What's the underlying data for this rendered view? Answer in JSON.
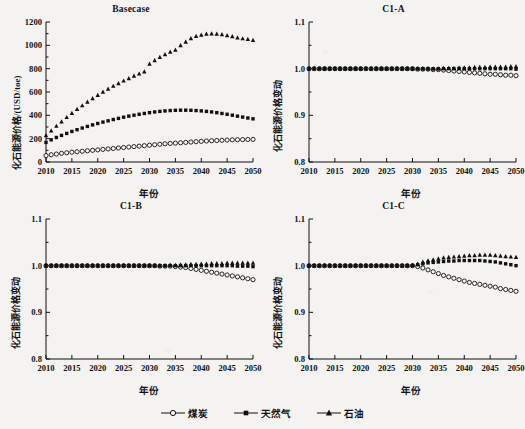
{
  "figure": {
    "xlabel": "年份",
    "legend": [
      {
        "name": "coal",
        "label": "煤炭",
        "marker": "open-circle"
      },
      {
        "name": "natural-gas",
        "label": "天然气",
        "marker": "filled-square"
      },
      {
        "name": "oil",
        "label": "石油",
        "marker": "filled-triangle"
      }
    ]
  },
  "chart_data": [
    {
      "type": "scatter",
      "title": "Basecase",
      "xlabel": "年份",
      "ylabel": "化石能源价格/(USD/toe)",
      "xlim": [
        2010,
        2050
      ],
      "ylim": [
        0,
        1200
      ],
      "xticks": [
        2010,
        2015,
        2020,
        2025,
        2030,
        2035,
        2040,
        2045,
        2050
      ],
      "yticks": [
        0,
        200,
        400,
        600,
        800,
        1000,
        1200
      ],
      "grid": false,
      "legend_position": "figure-bottom",
      "x": [
        2010,
        2011,
        2012,
        2013,
        2014,
        2015,
        2016,
        2017,
        2018,
        2019,
        2020,
        2021,
        2022,
        2023,
        2024,
        2025,
        2026,
        2027,
        2028,
        2029,
        2030,
        2031,
        2032,
        2033,
        2034,
        2035,
        2036,
        2037,
        2038,
        2039,
        2040,
        2041,
        2042,
        2043,
        2044,
        2045,
        2046,
        2047,
        2048,
        2049,
        2050
      ],
      "series": [
        {
          "name": "煤炭",
          "marker": "open-circle",
          "values": [
            55,
            62,
            68,
            74,
            79,
            84,
            88,
            92,
            96,
            100,
            104,
            108,
            112,
            116,
            120,
            124,
            128,
            132,
            136,
            140,
            144,
            148,
            152,
            156,
            159,
            162,
            165,
            168,
            171,
            174,
            177,
            180,
            182,
            184,
            186,
            188,
            190,
            191,
            192,
            193,
            194
          ]
        },
        {
          "name": "天然气",
          "marker": "filled-square",
          "values": [
            168,
            190,
            210,
            228,
            245,
            262,
            277,
            291,
            305,
            318,
            330,
            342,
            353,
            364,
            374,
            384,
            393,
            401,
            409,
            416,
            423,
            429,
            434,
            438,
            441,
            443,
            444,
            444,
            443,
            441,
            438,
            434,
            429,
            423,
            416,
            409,
            401,
            393,
            385,
            377,
            370
          ]
        },
        {
          "name": "石油",
          "marker": "filled-triangle",
          "values": [
            228,
            268,
            308,
            346,
            383,
            418,
            452,
            484,
            515,
            545,
            573,
            600,
            626,
            651,
            674,
            696,
            717,
            737,
            756,
            774,
            841,
            871,
            898,
            922,
            943,
            961,
            1000,
            1030,
            1060,
            1078,
            1090,
            1098,
            1100,
            1098,
            1093,
            1085,
            1076,
            1066,
            1058,
            1052,
            1045
          ]
        }
      ]
    },
    {
      "type": "scatter",
      "title": "C1-A",
      "xlabel": "年份",
      "ylabel": "化石能源价格变动",
      "xlim": [
        2010,
        2050
      ],
      "ylim": [
        0.8,
        1.1
      ],
      "xticks": [
        2010,
        2015,
        2020,
        2025,
        2030,
        2035,
        2040,
        2045,
        2050
      ],
      "yticks": [
        0.8,
        0.9,
        1.0,
        1.1
      ],
      "grid": false,
      "legend_position": "figure-bottom",
      "x": [
        2010,
        2011,
        2012,
        2013,
        2014,
        2015,
        2016,
        2017,
        2018,
        2019,
        2020,
        2021,
        2022,
        2023,
        2024,
        2025,
        2026,
        2027,
        2028,
        2029,
        2030,
        2031,
        2032,
        2033,
        2034,
        2035,
        2036,
        2037,
        2038,
        2039,
        2040,
        2041,
        2042,
        2043,
        2044,
        2045,
        2046,
        2047,
        2048,
        2049,
        2050
      ],
      "series": [
        {
          "name": "煤炭",
          "marker": "open-circle",
          "values": [
            1.0,
            1.0,
            1.0,
            1.0,
            1.0,
            1.0,
            1.0,
            1.0,
            1.0,
            1.0,
            1.0,
            1.0,
            1.0,
            1.0,
            1.0,
            1.0,
            1.0,
            1.0,
            1.0,
            1.0,
            1.0,
            0.999,
            0.999,
            0.999,
            0.998,
            0.998,
            0.997,
            0.996,
            0.995,
            0.994,
            0.993,
            0.992,
            0.991,
            0.99,
            0.989,
            0.988,
            0.988,
            0.987,
            0.986,
            0.986,
            0.985
          ]
        },
        {
          "name": "天然气",
          "marker": "filled-square",
          "values": [
            1.0,
            1.0,
            1.0,
            1.0,
            1.0,
            1.0,
            1.0,
            1.0,
            1.0,
            1.0,
            1.0,
            1.0,
            1.0,
            1.0,
            1.0,
            1.0,
            1.0,
            1.0,
            1.0,
            1.0,
            1.0,
            1.0,
            1.0,
            1.0,
            1.0,
            1.0,
            1.0,
            1.0,
            1.0,
            1.0,
            1.0,
            1.0,
            1.0,
            1.0,
            1.0,
            1.0,
            1.0,
            1.0,
            1.0,
            1.0,
            0.999
          ]
        },
        {
          "name": "石油",
          "marker": "filled-triangle",
          "values": [
            1.0,
            1.0,
            1.0,
            1.0,
            1.0,
            1.0,
            1.0,
            1.0,
            1.0,
            1.0,
            1.0,
            1.0,
            1.0,
            1.0,
            1.0,
            1.0,
            1.0,
            1.0,
            1.0,
            1.0,
            1.0,
            1.0,
            1.0,
            1.0,
            1.0,
            1.0,
            1.001,
            1.001,
            1.001,
            1.002,
            1.002,
            1.002,
            1.003,
            1.003,
            1.003,
            1.004,
            1.004,
            1.004,
            1.004,
            1.005,
            1.005
          ]
        }
      ]
    },
    {
      "type": "scatter",
      "title": "C1-B",
      "xlabel": "年份",
      "ylabel": "化石能源价格变动",
      "xlim": [
        2010,
        2050
      ],
      "ylim": [
        0.8,
        1.1
      ],
      "xticks": [
        2010,
        2015,
        2020,
        2025,
        2030,
        2035,
        2040,
        2045,
        2050
      ],
      "yticks": [
        0.8,
        0.9,
        1.0,
        1.1
      ],
      "grid": false,
      "legend_position": "figure-bottom",
      "x": [
        2010,
        2011,
        2012,
        2013,
        2014,
        2015,
        2016,
        2017,
        2018,
        2019,
        2020,
        2021,
        2022,
        2023,
        2024,
        2025,
        2026,
        2027,
        2028,
        2029,
        2030,
        2031,
        2032,
        2033,
        2034,
        2035,
        2036,
        2037,
        2038,
        2039,
        2040,
        2041,
        2042,
        2043,
        2044,
        2045,
        2046,
        2047,
        2048,
        2049,
        2050
      ],
      "series": [
        {
          "name": "煤炭",
          "marker": "open-circle",
          "values": [
            1.0,
            1.0,
            1.0,
            1.0,
            1.0,
            1.0,
            1.0,
            1.0,
            1.0,
            1.0,
            1.0,
            1.0,
            1.0,
            1.0,
            1.0,
            1.0,
            1.0,
            1.0,
            1.0,
            1.0,
            1.0,
            1.0,
            0.999,
            0.999,
            0.999,
            0.998,
            0.997,
            0.996,
            0.994,
            0.992,
            0.99,
            0.988,
            0.986,
            0.984,
            0.982,
            0.98,
            0.978,
            0.976,
            0.974,
            0.972,
            0.97
          ]
        },
        {
          "name": "天然气",
          "marker": "filled-square",
          "values": [
            1.0,
            1.0,
            1.0,
            1.0,
            1.0,
            1.0,
            1.0,
            1.0,
            1.0,
            1.0,
            1.0,
            1.0,
            1.0,
            1.0,
            1.0,
            1.0,
            1.0,
            1.0,
            1.0,
            1.0,
            1.0,
            1.0,
            1.0,
            1.0,
            1.0,
            1.0,
            1.0,
            1.0,
            1.0,
            1.0,
            1.0,
            1.0,
            1.0,
            1.0,
            1.0,
            1.0,
            1.0,
            0.999,
            0.999,
            0.999,
            0.998
          ]
        },
        {
          "name": "石油",
          "marker": "filled-triangle",
          "values": [
            1.0,
            1.0,
            1.0,
            1.0,
            1.0,
            1.0,
            1.0,
            1.0,
            1.0,
            1.0,
            1.0,
            1.0,
            1.0,
            1.0,
            1.0,
            1.0,
            1.0,
            1.0,
            1.0,
            1.0,
            1.0,
            1.0,
            1.0,
            1.0,
            1.001,
            1.001,
            1.002,
            1.002,
            1.003,
            1.003,
            1.004,
            1.004,
            1.005,
            1.005,
            1.005,
            1.006,
            1.006,
            1.006,
            1.006,
            1.006,
            1.006
          ]
        }
      ]
    },
    {
      "type": "scatter",
      "title": "C1-C",
      "xlabel": "年份",
      "ylabel": "化石能源价格变动",
      "xlim": [
        2010,
        2050
      ],
      "ylim": [
        0.8,
        1.1
      ],
      "xticks": [
        2010,
        2015,
        2020,
        2025,
        2030,
        2035,
        2040,
        2045,
        2050
      ],
      "yticks": [
        0.8,
        0.9,
        1.0,
        1.1
      ],
      "grid": false,
      "legend_position": "figure-bottom",
      "x": [
        2010,
        2011,
        2012,
        2013,
        2014,
        2015,
        2016,
        2017,
        2018,
        2019,
        2020,
        2021,
        2022,
        2023,
        2024,
        2025,
        2026,
        2027,
        2028,
        2029,
        2030,
        2031,
        2032,
        2033,
        2034,
        2035,
        2036,
        2037,
        2038,
        2039,
        2040,
        2041,
        2042,
        2043,
        2044,
        2045,
        2046,
        2047,
        2048,
        2049,
        2050
      ],
      "series": [
        {
          "name": "煤炭",
          "marker": "open-circle",
          "values": [
            1.0,
            1.0,
            1.0,
            1.0,
            1.0,
            1.0,
            1.0,
            1.0,
            1.0,
            1.0,
            1.0,
            1.0,
            1.0,
            1.0,
            1.0,
            1.0,
            1.0,
            1.0,
            1.0,
            1.0,
            1.0,
            0.998,
            0.995,
            0.991,
            0.987,
            0.983,
            0.979,
            0.976,
            0.973,
            0.97,
            0.967,
            0.964,
            0.962,
            0.96,
            0.958,
            0.956,
            0.954,
            0.951,
            0.949,
            0.947,
            0.945
          ]
        },
        {
          "name": "天然气",
          "marker": "filled-square",
          "values": [
            1.0,
            1.0,
            1.0,
            1.0,
            1.0,
            1.0,
            1.0,
            1.0,
            1.0,
            1.0,
            1.0,
            1.0,
            1.0,
            1.0,
            1.0,
            1.0,
            1.0,
            1.0,
            1.0,
            1.0,
            1.0,
            1.002,
            1.004,
            1.006,
            1.007,
            1.008,
            1.009,
            1.01,
            1.01,
            1.011,
            1.011,
            1.011,
            1.011,
            1.011,
            1.01,
            1.009,
            1.008,
            1.006,
            1.004,
            1.002,
            1.0
          ]
        },
        {
          "name": "石油",
          "marker": "filled-triangle",
          "values": [
            1.0,
            1.0,
            1.0,
            1.0,
            1.0,
            1.0,
            1.0,
            1.0,
            1.0,
            1.0,
            1.0,
            1.0,
            1.0,
            1.0,
            1.0,
            1.0,
            1.0,
            1.0,
            1.0,
            1.0,
            1.001,
            1.004,
            1.008,
            1.011,
            1.013,
            1.015,
            1.017,
            1.018,
            1.019,
            1.02,
            1.021,
            1.022,
            1.022,
            1.023,
            1.023,
            1.023,
            1.022,
            1.021,
            1.02,
            1.019,
            1.018
          ]
        }
      ]
    }
  ]
}
